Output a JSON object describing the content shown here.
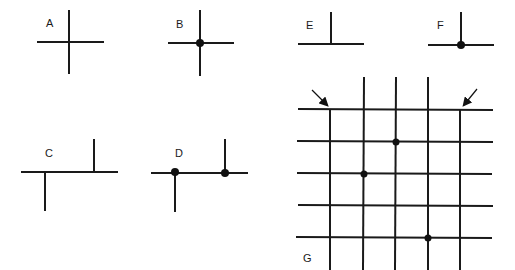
{
  "colors": {
    "line": "#1a1a1a",
    "dot": "#111111",
    "background": "#ffffff"
  },
  "panels": [
    {
      "id": "A",
      "label": "A",
      "description": "plain crossing, no junction dot"
    },
    {
      "id": "B",
      "label": "B",
      "description": "crossing with junction dot"
    },
    {
      "id": "C",
      "label": "C",
      "description": "two offset T-junctions, no dots"
    },
    {
      "id": "D",
      "label": "D",
      "description": "two offset T-junctions with dots"
    },
    {
      "id": "E",
      "label": "E",
      "description": "T-junction, no dot"
    },
    {
      "id": "F",
      "label": "F",
      "description": "T-junction with dot"
    },
    {
      "id": "G",
      "label": "G",
      "description": "grid of 5 vertical and 5 horizontal lines; outer verticals start at top line (arrows); 3 junction dots"
    }
  ],
  "grid": {
    "verticals_x": [
      330,
      364,
      396,
      428,
      460
    ],
    "horizontals_y": [
      109,
      141,
      173,
      205,
      237
    ],
    "dots": [
      {
        "col": 3,
        "row": 2
      },
      {
        "col": 2,
        "row": 3
      },
      {
        "col": 4,
        "row": 5
      }
    ],
    "arrows": [
      "arrow-left-top",
      "arrow-right-top"
    ]
  }
}
